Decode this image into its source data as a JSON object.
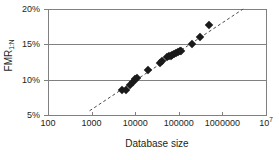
{
  "chart_data": {
    "type": "scatter",
    "title": "",
    "xlabel": "Database size",
    "ylabel": "FMR",
    "ylabel_subscript": "1:N",
    "xscale": "log",
    "yscale": "linear",
    "xlim": [
      100,
      10000000
    ],
    "ylim": [
      5,
      20
    ],
    "grid": true,
    "legend": null,
    "x_tick_labels": [
      "100",
      "1000",
      "10000",
      "100000",
      "1000000",
      "10"
    ],
    "x_tick_exponent_last": "7",
    "x_tick_values": [
      100,
      1000,
      10000,
      100000,
      1000000,
      10000000
    ],
    "y_tick_labels": [
      "5%",
      "10%",
      "15%",
      "20%"
    ],
    "y_tick_values": [
      5,
      10,
      15,
      20
    ],
    "marker_shape": "diamond",
    "marker_color": "#1a1a1a",
    "points": [
      {
        "x": 5000,
        "y": 8.5
      },
      {
        "x": 6200,
        "y": 8.6
      },
      {
        "x": 7800,
        "y": 9.2
      },
      {
        "x": 9000,
        "y": 9.7
      },
      {
        "x": 10000,
        "y": 10.1
      },
      {
        "x": 11000,
        "y": 10.2
      },
      {
        "x": 20000,
        "y": 11.3
      },
      {
        "x": 38000,
        "y": 12.4
      },
      {
        "x": 42000,
        "y": 12.6
      },
      {
        "x": 55000,
        "y": 13.2
      },
      {
        "x": 60000,
        "y": 13.3
      },
      {
        "x": 65000,
        "y": 13.4
      },
      {
        "x": 70000,
        "y": 13.5
      },
      {
        "x": 78000,
        "y": 13.6
      },
      {
        "x": 85000,
        "y": 13.8
      },
      {
        "x": 95000,
        "y": 13.9
      },
      {
        "x": 105000,
        "y": 14.0
      },
      {
        "x": 115000,
        "y": 14.1
      },
      {
        "x": 200000,
        "y": 15.0
      },
      {
        "x": 300000,
        "y": 16.1
      },
      {
        "x": 480000,
        "y": 17.7
      }
    ],
    "trendline": {
      "style": "dashed",
      "color": "#4d4d4d",
      "x_start": 900,
      "y_start": 5.6,
      "x_end": 3000000,
      "y_end": 20.0
    }
  }
}
